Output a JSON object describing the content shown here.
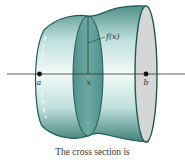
{
  "figure": {
    "function_label": "f(x)",
    "point_a_label": "a",
    "point_x_label": "x",
    "point_b_label": "b",
    "caption": "The cross section is"
  },
  "colors": {
    "solid_fill": "#6aa9a3",
    "solid_highlight": "#e6f3f1",
    "outline": "#1f5a55",
    "cross_section": "#5f9e97",
    "end_cap": "#d3d3d3",
    "axis": "#333333"
  }
}
